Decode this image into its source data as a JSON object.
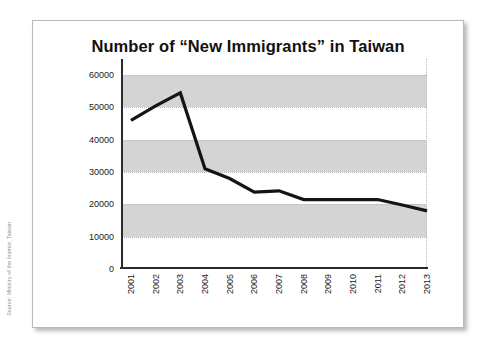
{
  "source_note": "Source: Ministry of the Interior, Taiwan",
  "chart_data": {
    "type": "line",
    "title": "Number of “New Immigrants” in Taiwan",
    "xlabel": "",
    "ylabel": "",
    "categories": [
      "2001",
      "2002",
      "2003",
      "2004",
      "2005",
      "2006",
      "2007",
      "2008",
      "2009",
      "2010",
      "2011",
      "2012",
      "2013"
    ],
    "values": [
      46000,
      50500,
      54500,
      31000,
      28000,
      23800,
      24200,
      21500,
      21500,
      21500,
      21500,
      19800,
      18000
    ],
    "series": [
      {
        "name": "New Immigrants",
        "values": [
          46000,
          50500,
          54500,
          31000,
          28000,
          23800,
          24200,
          21500,
          21500,
          21500,
          21500,
          19800,
          18000
        ]
      }
    ],
    "ylim": [
      0,
      65000
    ],
    "yticks": [
      0,
      10000,
      20000,
      30000,
      40000,
      50000,
      60000
    ],
    "ytick_labels": [
      "0",
      "10000",
      "20000",
      "30000",
      "40000",
      "50000",
      "60000"
    ],
    "grid": true,
    "grid_style": "dotted-horizontal",
    "legend": false,
    "legend_position": "none",
    "banded_background": true,
    "bands": [
      {
        "from": 10000,
        "to": 20000
      },
      {
        "from": 30000,
        "to": 40000
      },
      {
        "from": 50000,
        "to": 60000
      }
    ],
    "colors": {
      "line": "#141414",
      "band": "#d4d4d4",
      "grid": "#b5b5b5",
      "axis": "#2b2b2b",
      "text": "#1c1c1c",
      "card_border": "#b9b9b9",
      "background": "#ffffff"
    }
  }
}
